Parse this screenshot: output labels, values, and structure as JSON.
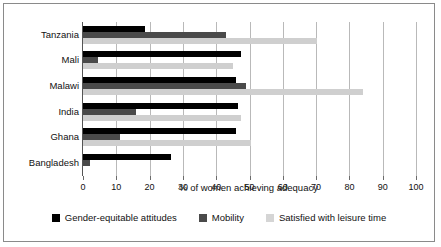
{
  "chart_data": {
    "type": "bar",
    "orientation": "horizontal",
    "title": "",
    "xlabel": "% of women achieving adequacy",
    "ylabel": "",
    "xlim": [
      0,
      100
    ],
    "xticks": [
      0,
      10,
      20,
      30,
      40,
      50,
      60,
      70,
      80,
      90,
      100
    ],
    "xticklabels": [
      "0",
      "10",
      "20",
      "30",
      "40",
      "50",
      "60",
      "70",
      "80",
      "90",
      "100"
    ],
    "grid": true,
    "grid_axis": "x",
    "legend_position": "bottom",
    "categories": [
      "Tanzania",
      "Mali",
      "Malawi",
      "India",
      "Ghana",
      "Bangladesh"
    ],
    "series": [
      {
        "name": "Gender-equitable attitudes",
        "color": "#000000",
        "values": [
          18.6,
          47.5,
          46.0,
          46.5,
          46.0,
          26.5
        ]
      },
      {
        "name": "Mobility",
        "color": "#4a4a4a",
        "values": [
          42.9,
          4.5,
          49.0,
          16.0,
          11.0,
          2.0
        ]
      },
      {
        "name": "Satisfied with leisure time",
        "color": "#cfcfcf",
        "values": [
          70.3,
          45.0,
          84.0,
          47.5,
          50.5,
          0.0
        ]
      }
    ]
  },
  "legend": {
    "items": [
      {
        "label": "Gender-equitable attitudes"
      },
      {
        "label": "Mobility"
      },
      {
        "label": "Satisfied with leisure time"
      }
    ]
  }
}
